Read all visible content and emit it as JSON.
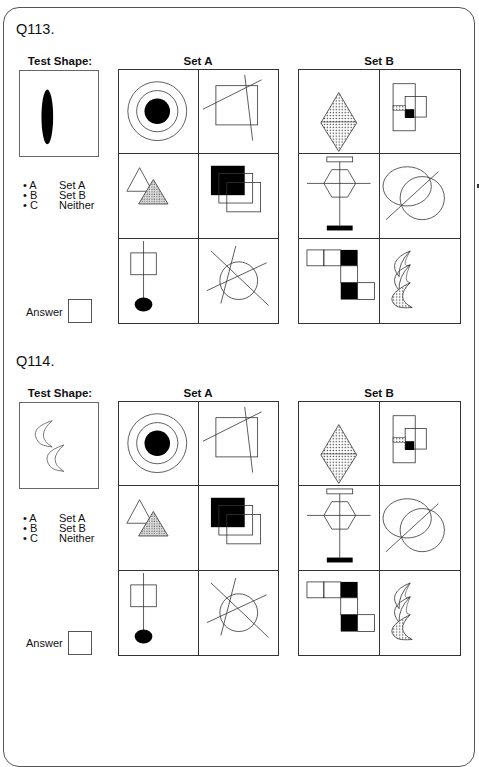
{
  "questions": [
    {
      "id": "Q113.",
      "test_shape_label": "Test Shape:",
      "test_shape": "black-vertical-ellipse",
      "set_a_label": "Set A",
      "set_b_label": "Set B",
      "options": [
        {
          "letter": "A",
          "text": "Set A"
        },
        {
          "letter": "B",
          "text": "Set B"
        },
        {
          "letter": "C",
          "text": "Neither"
        }
      ],
      "answer_label": "Answer",
      "answer_value": ""
    },
    {
      "id": "Q114.",
      "test_shape_label": "Test Shape:",
      "test_shape": "two-outline-crescents",
      "set_a_label": "Set A",
      "set_b_label": "Set B",
      "options": [
        {
          "letter": "A",
          "text": "Set A"
        },
        {
          "letter": "B",
          "text": "Set B"
        },
        {
          "letter": "C",
          "text": "Neither"
        }
      ],
      "answer_label": "Answer",
      "answer_value": ""
    }
  ],
  "set_a_cells": [
    "concentric-circles-black-center",
    "square-with-crossing-lines",
    "outline-and-dotted-triangles",
    "black-square-with-two-outline-squares",
    "square-on-line-with-black-ellipse",
    "circle-with-three-crossing-lines"
  ],
  "set_b_cells": [
    "dotted-diamond",
    "overlapping-rectangles-with-black-and-patterned-squares",
    "hexagon-with-cross-and-bars",
    "two-circles-with-diagonal-line",
    "checker-block-path",
    "three-crescents-one-patterned"
  ],
  "bullet": "•"
}
